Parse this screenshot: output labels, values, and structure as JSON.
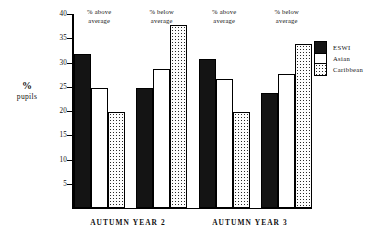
{
  "chart_data": {
    "type": "bar",
    "title": "",
    "xlabel": "",
    "ylabel": "% pupils",
    "ylim": [
      0,
      40
    ],
    "yticks": [
      5,
      10,
      15,
      20,
      25,
      30,
      35,
      40
    ],
    "ytick_labels": [
      "5",
      "10",
      "15",
      "20",
      "25",
      "30",
      "35",
      "40"
    ],
    "grid": false,
    "legend_position": "right",
    "group_captions": [
      "% above\naverage",
      "% below\naverage",
      "% above\naverage",
      "% below\naverage"
    ],
    "categories": [
      "AUTUMN YEAR 2 / % above average",
      "AUTUMN YEAR 2 / % below average",
      "AUTUMN YEAR 3 / % above average",
      "AUTUMN YEAR 3 / % below average"
    ],
    "series": [
      {
        "name": "ESWI",
        "values": [
          31.8,
          24.8,
          30.7,
          23.7
        ],
        "fill": "solid-black"
      },
      {
        "name": "Asian",
        "values": [
          24.8,
          28.7,
          26.7,
          27.7
        ],
        "fill": "white"
      },
      {
        "name": "Caribbean",
        "values": [
          19.8,
          37.8,
          19.7,
          33.8
        ],
        "fill": "stippled"
      }
    ],
    "x_group_labels": [
      "AUTUMN YEAR 2",
      "AUTUMN YEAR 3"
    ]
  },
  "axis": {
    "y_title_symbol": "%",
    "y_title_word": "pupils",
    "tick_labels": [
      "40",
      "35",
      "30",
      "25",
      "20",
      "15",
      "10",
      "5"
    ],
    "tick_values": [
      40,
      35,
      30,
      25,
      20,
      15,
      10,
      5
    ]
  },
  "captions": [
    {
      "line1": "% above",
      "line2": "average"
    },
    {
      "line1": "% below",
      "line2": "average"
    },
    {
      "line1": "% above",
      "line2": "average"
    },
    {
      "line1": "% below",
      "line2": "average"
    }
  ],
  "x_labels": [
    {
      "text": "AUTUMN YEAR 2"
    },
    {
      "text": "AUTUMN YEAR 3"
    }
  ],
  "legend": {
    "items": [
      {
        "label": "ESWI",
        "fill": "solid-black"
      },
      {
        "label": "Asian",
        "fill": "white"
      },
      {
        "label": "Caribbean",
        "fill": "stippled"
      }
    ]
  },
  "colors": {
    "axis": "#000000",
    "eswi_fill": "#141414",
    "asian_fill": "#ffffff",
    "caribbean_fill": "#fdfdfd",
    "text": "#111111",
    "background": "#ffffff"
  }
}
